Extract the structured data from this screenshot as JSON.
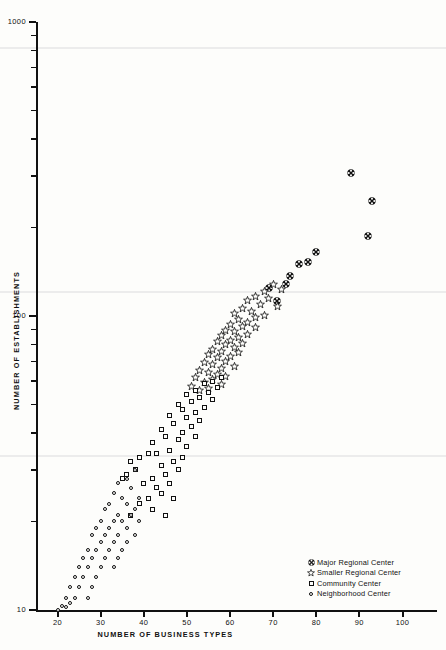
{
  "chart_data": {
    "type": "scatter",
    "title": "",
    "xlabel": "NUMBER OF BUSINESS TYPES",
    "ylabel": "NUMBER OF ESTABLISHMENTS",
    "xscale": "linear",
    "yscale": "log",
    "xlim": [
      15,
      108
    ],
    "ylim": [
      10,
      1000
    ],
    "grid": false,
    "legend_position": "bottom-right",
    "xticks": [
      20,
      30,
      40,
      50,
      60,
      70,
      80,
      90,
      100
    ],
    "xtick_labels": [
      "20",
      "30",
      "40",
      "50",
      "60",
      "70",
      "80",
      "90",
      "100"
    ],
    "yticks": [
      10,
      20,
      30,
      40,
      50,
      60,
      70,
      80,
      90,
      100,
      200,
      300,
      400,
      500,
      600,
      700,
      800,
      900,
      1000
    ],
    "ytick_labels_shown": [
      "10",
      "100",
      "1000"
    ],
    "series": [
      {
        "name": "Major Regional Center",
        "marker": "filled-patterned-circle",
        "points": [
          [
            88,
            320
          ],
          [
            93,
            258
          ],
          [
            92,
            196
          ],
          [
            80,
            173
          ],
          [
            78,
            160
          ],
          [
            76,
            158
          ],
          [
            74,
            143
          ],
          [
            73,
            135
          ],
          [
            71,
            118
          ],
          [
            69,
            131
          ]
        ]
      },
      {
        "name": "Smaller Regional Center",
        "marker": "open-star",
        "points": [
          [
            70,
            133
          ],
          [
            72,
            128
          ],
          [
            68,
            126
          ],
          [
            66,
            121
          ],
          [
            69,
            119
          ],
          [
            64,
            117
          ],
          [
            67,
            114
          ],
          [
            71,
            112
          ],
          [
            63,
            110
          ],
          [
            65,
            108
          ],
          [
            61,
            106
          ],
          [
            68,
            104
          ],
          [
            66,
            103
          ],
          [
            62,
            101
          ],
          [
            64,
            99
          ],
          [
            60,
            97
          ],
          [
            63,
            96
          ],
          [
            66,
            95
          ],
          [
            59,
            93
          ],
          [
            61,
            92
          ],
          [
            64,
            90
          ],
          [
            58,
            89
          ],
          [
            62,
            88
          ],
          [
            60,
            86
          ],
          [
            57,
            85
          ],
          [
            63,
            84
          ],
          [
            59,
            83
          ],
          [
            61,
            81
          ],
          [
            56,
            80
          ],
          [
            58,
            79
          ],
          [
            62,
            78
          ],
          [
            55,
            77
          ],
          [
            60,
            76
          ],
          [
            57,
            75
          ],
          [
            59,
            73
          ],
          [
            54,
            72
          ],
          [
            56,
            71
          ],
          [
            61,
            70
          ],
          [
            58,
            69
          ],
          [
            53,
            68
          ],
          [
            55,
            67
          ],
          [
            57,
            66
          ],
          [
            59,
            65
          ],
          [
            52,
            64
          ],
          [
            56,
            63
          ],
          [
            54,
            62
          ],
          [
            58,
            61
          ],
          [
            51,
            60
          ],
          [
            55,
            59
          ],
          [
            53,
            58
          ]
        ]
      },
      {
        "name": "Community Center",
        "marker": "open-square",
        "points": [
          [
            58,
            62
          ],
          [
            56,
            60
          ],
          [
            54,
            59
          ],
          [
            57,
            57
          ],
          [
            52,
            56
          ],
          [
            55,
            55
          ],
          [
            50,
            54
          ],
          [
            53,
            53
          ],
          [
            56,
            52
          ],
          [
            51,
            51
          ],
          [
            48,
            50
          ],
          [
            54,
            49
          ],
          [
            49,
            48
          ],
          [
            52,
            47
          ],
          [
            46,
            46
          ],
          [
            50,
            45
          ],
          [
            53,
            44
          ],
          [
            47,
            43
          ],
          [
            51,
            42
          ],
          [
            44,
            41
          ],
          [
            49,
            40
          ],
          [
            45,
            39
          ],
          [
            52,
            39
          ],
          [
            48,
            38
          ],
          [
            42,
            37
          ],
          [
            50,
            36
          ],
          [
            46,
            35
          ],
          [
            43,
            34
          ],
          [
            49,
            33
          ],
          [
            47,
            32
          ],
          [
            41,
            34
          ],
          [
            44,
            31
          ],
          [
            39,
            33
          ],
          [
            48,
            30
          ],
          [
            45,
            29
          ],
          [
            37,
            32
          ],
          [
            42,
            28
          ],
          [
            46,
            27
          ],
          [
            40,
            27
          ],
          [
            43,
            26
          ],
          [
            38,
            30
          ],
          [
            36,
            29
          ],
          [
            44,
            25
          ],
          [
            41,
            24
          ],
          [
            47,
            24
          ],
          [
            35,
            28
          ],
          [
            39,
            23
          ],
          [
            42,
            22
          ],
          [
            45,
            21
          ],
          [
            37,
            21
          ]
        ]
      },
      {
        "name": "Neighborhood Center",
        "marker": "small-open-circle",
        "points": [
          [
            38,
            30
          ],
          [
            36,
            28
          ],
          [
            34,
            27
          ],
          [
            37,
            26
          ],
          [
            33,
            25
          ],
          [
            35,
            24
          ],
          [
            39,
            24
          ],
          [
            32,
            23
          ],
          [
            36,
            23
          ],
          [
            38,
            22
          ],
          [
            31,
            22
          ],
          [
            34,
            21
          ],
          [
            37,
            21
          ],
          [
            30,
            20
          ],
          [
            33,
            20
          ],
          [
            35,
            20
          ],
          [
            39,
            20
          ],
          [
            29,
            19
          ],
          [
            32,
            19
          ],
          [
            36,
            19
          ],
          [
            31,
            18
          ],
          [
            34,
            18
          ],
          [
            38,
            18
          ],
          [
            28,
            18
          ],
          [
            30,
            17
          ],
          [
            33,
            17
          ],
          [
            36,
            17
          ],
          [
            27,
            16
          ],
          [
            29,
            16
          ],
          [
            32,
            16
          ],
          [
            35,
            16
          ],
          [
            26,
            15
          ],
          [
            31,
            15
          ],
          [
            34,
            15
          ],
          [
            28,
            15
          ],
          [
            25,
            14
          ],
          [
            30,
            14
          ],
          [
            33,
            14
          ],
          [
            27,
            14
          ],
          [
            24,
            13
          ],
          [
            29,
            13
          ],
          [
            26,
            13
          ],
          [
            23,
            12
          ],
          [
            28,
            12
          ],
          [
            25,
            12
          ],
          [
            22,
            11
          ],
          [
            24,
            11
          ],
          [
            27,
            11
          ],
          [
            23,
            10.6
          ],
          [
            21,
            10.3
          ],
          [
            22,
            10.2
          ],
          [
            20,
            10.0
          ]
        ]
      }
    ]
  },
  "axes": {
    "y_title": "NUMBER OF ESTABLISHMENTS",
    "x_title": "NUMBER OF BUSINESS TYPES",
    "y_top_label": "1000",
    "y_mid_label": "100",
    "y_bottom_label": "10"
  },
  "legend": {
    "items": [
      {
        "label": "Major Regional Center",
        "marker": "filled-patterned-circle"
      },
      {
        "label": "Smaller Regional Center",
        "marker": "open-star"
      },
      {
        "label": "Community Center",
        "marker": "open-square"
      },
      {
        "label": "Neighborhood Center",
        "marker": "small-open-circle"
      }
    ]
  }
}
